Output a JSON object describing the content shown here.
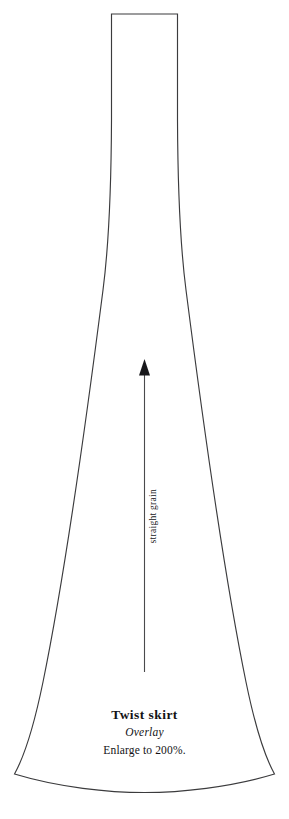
{
  "document": {
    "kind": "sewing-pattern-piece",
    "background_color": "#ffffff",
    "width": 289,
    "height": 819
  },
  "pattern_piece": {
    "outline_color": "#3b3b3d",
    "fill_color": "#ffffff",
    "outline_path": "M 111.5 14 L 177.5 14 L 177.5 120 C 177.8 190 179.5 240 186.0 290 C 196.5 372 221.0 560 246.0 682 C 254.0 721 264.0 755 274.5 774.0 C 230.0 787.5 180.0 792.5 144.5 792.5 C 109.0 792.5 59.0 787.5 14.5 774.0 C 25.0 755 35.0 721 43.0 682 C 68.0 560 92.5 372 103.0 290 C 109.5 240 111.2 190 111.5 120 Z"
  },
  "grain_line": {
    "name": "straight-grain-marker",
    "label": "straight grain",
    "color": "#17171a",
    "arrow_tip_y": 359,
    "arrow_base_y": 375,
    "arrow_half_width": 5.5,
    "stem_x": 144.5,
    "stem_bottom_y": 672,
    "arrow_path": "M 144.5 359 L 150.0 375.5 L 139.0 375.5 Z"
  },
  "labels": {
    "title": "Twist skirt",
    "subtitle": "Overlay",
    "instruction": "Enlarge to 200%."
  }
}
